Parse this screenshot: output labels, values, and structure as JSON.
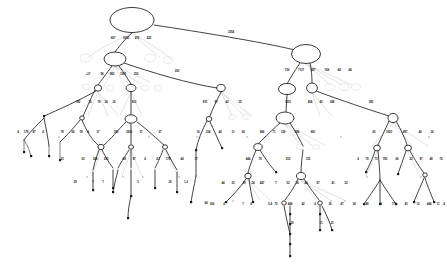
{
  "diagram": {
    "type": "tree",
    "background_color": "#ffffff",
    "node_fill": "#ffffff",
    "node_stroke": "#222222",
    "edge_color": "#2b2b2b",
    "ghost_color": "#c9c9c9",
    "leaf_color": "#1c1c1c",
    "canvas": {
      "width": 447,
      "height": 264
    }
  },
  "nodes": [
    {
      "id": "n-root",
      "shape": "ellipse",
      "cx": 132,
      "cy": 20,
      "rx": 22,
      "ry": 12.5
    },
    {
      "id": "n-l1",
      "shape": "ellipse",
      "cx": 115,
      "cy": 59,
      "rx": 11,
      "ry": 7
    },
    {
      "id": "n-r1",
      "shape": "ellipse",
      "cx": 306,
      "cy": 54,
      "rx": 14.5,
      "ry": 9.5
    },
    {
      "id": "n-l2a",
      "shape": "ellipse",
      "cx": 98,
      "cy": 88,
      "rx": 3.6,
      "ry": 3.2
    },
    {
      "id": "n-l2b",
      "shape": "ellipse",
      "cx": 131,
      "cy": 88,
      "rx": 5,
      "ry": 3.6
    },
    {
      "id": "n-l2c",
      "shape": "ellipse",
      "cx": 221,
      "cy": 88,
      "rx": 4.2,
      "ry": 3.6
    },
    {
      "id": "n-r2a",
      "shape": "ellipse",
      "cx": 287,
      "cy": 89,
      "rx": 8.5,
      "ry": 5.6
    },
    {
      "id": "n-r2b",
      "shape": "ellipse",
      "cx": 312,
      "cy": 88,
      "rx": 5.4,
      "ry": 5
    },
    {
      "id": "n-l3a",
      "shape": "ellipse",
      "cx": 82,
      "cy": 118,
      "rx": 2.3,
      "ry": 2.1
    },
    {
      "id": "n-l3b",
      "shape": "ellipse",
      "cx": 131,
      "cy": 119,
      "rx": 6,
      "ry": 4.2
    },
    {
      "id": "n-l3c",
      "shape": "ellipse",
      "cx": 209,
      "cy": 119,
      "rx": 2.8,
      "ry": 2.5
    },
    {
      "id": "n-r3a",
      "shape": "ellipse",
      "cx": 285,
      "cy": 118,
      "rx": 9,
      "ry": 6
    },
    {
      "id": "n-r3b",
      "shape": "ellipse",
      "cx": 393,
      "cy": 118,
      "rx": 5,
      "ry": 4.6
    },
    {
      "id": "n-l4a",
      "shape": "ellipse",
      "cx": 101,
      "cy": 147,
      "rx": 3.1,
      "ry": 2.7
    },
    {
      "id": "n-l4b",
      "shape": "ellipse",
      "cx": 131,
      "cy": 147,
      "rx": 2.5,
      "ry": 2.2
    },
    {
      "id": "n-l4c",
      "shape": "ellipse",
      "cx": 165,
      "cy": 147,
      "rx": 2.5,
      "ry": 2.2
    },
    {
      "id": "n-r4a",
      "shape": "ellipse",
      "cx": 258,
      "cy": 147,
      "rx": 4.2,
      "ry": 3.4
    },
    {
      "id": "n-r4b",
      "shape": "ellipse",
      "cx": 377,
      "cy": 148,
      "rx": 3.4,
      "ry": 2.9
    },
    {
      "id": "n-r4c",
      "shape": "ellipse",
      "cx": 408,
      "cy": 148,
      "rx": 3.4,
      "ry": 2.9
    },
    {
      "id": "n-r5a",
      "shape": "ellipse",
      "cx": 248,
      "cy": 176,
      "rx": 3.2,
      "ry": 2.8
    },
    {
      "id": "n-r5b",
      "shape": "ellipse",
      "cx": 301,
      "cy": 176,
      "rx": 4.6,
      "ry": 3.6
    },
    {
      "id": "n-r6a",
      "shape": "ellipse",
      "cx": 284,
      "cy": 203,
      "rx": 2.3,
      "ry": 2.1
    },
    {
      "id": "n-r6b",
      "shape": "ellipse",
      "cx": 320,
      "cy": 203,
      "rx": 2.3,
      "ry": 2.1
    },
    {
      "id": "n-r7a",
      "shape": "ellipse",
      "cx": 425,
      "cy": 175,
      "rx": 2.3,
      "ry": 2.1
    }
  ],
  "edge_labels": [
    {
      "id": "e-root-1",
      "text": "667",
      "x": 113,
      "y": 39
    },
    {
      "id": "e-root-2",
      "text": "5000",
      "x": 126,
      "y": 39
    },
    {
      "id": "e-root-3",
      "text": "476",
      "x": 137,
      "y": 39
    },
    {
      "id": "e-root-4",
      "text": "425",
      "x": 149,
      "y": 39
    },
    {
      "id": "e-root-5",
      "text": "2354",
      "x": 231,
      "y": 33
    },
    {
      "id": "e-l1-1",
      "text": "+17",
      "x": 88,
      "y": 75
    },
    {
      "id": "e-l1-2",
      "text": "96",
      "x": 102,
      "y": 75
    },
    {
      "id": "e-l1-3",
      "text": "982",
      "x": 112,
      "y": 75
    },
    {
      "id": "e-l1-4",
      "text": "1267",
      "x": 123,
      "y": 75
    },
    {
      "id": "e-l1-5",
      "text": "250",
      "x": 136,
      "y": 75
    },
    {
      "id": "e-l1-6",
      "text": "200",
      "x": 177,
      "y": 72
    },
    {
      "id": "e-r1-1",
      "text": "736",
      "x": 287,
      "y": 71
    },
    {
      "id": "e-r1-2",
      "text": "7137",
      "x": 301,
      "y": 71
    },
    {
      "id": "e-r1-3",
      "text": "897",
      "x": 313,
      "y": 71
    },
    {
      "id": "e-r1-4",
      "text": "566",
      "x": 327,
      "y": 71
    },
    {
      "id": "e-r1-5",
      "text": "44",
      "x": 339,
      "y": 71
    },
    {
      "id": "e-r1-6",
      "text": "44",
      "x": 350,
      "y": 71
    },
    {
      "id": "e-l2a-1",
      "text": "782",
      "x": 78,
      "y": 103
    },
    {
      "id": "e-l2a-2",
      "text": "76",
      "x": 90,
      "y": 103
    },
    {
      "id": "e-l2a-3",
      "text": "78",
      "x": 99,
      "y": 103
    },
    {
      "id": "e-l2a-4",
      "text": "34",
      "x": 106,
      "y": 103
    },
    {
      "id": "e-l2a-5",
      "text": "22",
      "x": 114,
      "y": 103
    },
    {
      "id": "e-l2b-1",
      "text": "923",
      "x": 134,
      "y": 103
    },
    {
      "id": "e-l2c-1",
      "text": "931",
      "x": 205,
      "y": 103
    },
    {
      "id": "e-l2c-2",
      "text": "97",
      "x": 216,
      "y": 103
    },
    {
      "id": "e-l2c-3",
      "text": "42",
      "x": 227,
      "y": 103
    },
    {
      "id": "e-l2c-4",
      "text": "35",
      "x": 240,
      "y": 103
    },
    {
      "id": "e-r2a-1",
      "text": "1251",
      "x": 288,
      "y": 103
    },
    {
      "id": "e-r2b-1",
      "text": "408",
      "x": 310,
      "y": 103
    },
    {
      "id": "e-r2b-2",
      "text": "43",
      "x": 321,
      "y": 103
    },
    {
      "id": "e-r2b-3",
      "text": "348",
      "x": 332,
      "y": 103
    },
    {
      "id": "e-r2b-4",
      "text": "583",
      "x": 371,
      "y": 103
    },
    {
      "id": "e-l3a-1",
      "text": "4",
      "x": 18,
      "y": 133
    },
    {
      "id": "e-l3a-2",
      "text": "179",
      "x": 26,
      "y": 133
    },
    {
      "id": "e-l3a-3",
      "text": "87",
      "x": 34,
      "y": 133
    },
    {
      "id": "e-l3a-4",
      "text": "4",
      "x": 43,
      "y": 133
    },
    {
      "id": "e-l3a-5",
      "text": "78",
      "x": 62,
      "y": 133
    },
    {
      "id": "e-l3a-6",
      "text": "66",
      "x": 73,
      "y": 133
    },
    {
      "id": "e-l3a-7",
      "text": "78",
      "x": 81,
      "y": 133
    },
    {
      "id": "e-l3a-8",
      "text": "4",
      "x": 88,
      "y": 133
    },
    {
      "id": "e-l3a-9",
      "text": "37",
      "x": 98,
      "y": 133
    },
    {
      "id": "e-l3b-1",
      "text": "190",
      "x": 116,
      "y": 133
    },
    {
      "id": "e-l3b-2",
      "text": "3500",
      "x": 129,
      "y": 133
    },
    {
      "id": "e-l3b-3",
      "text": "37",
      "x": 141,
      "y": 133
    },
    {
      "id": "e-l3b-4",
      "text": "67",
      "x": 160,
      "y": 133
    },
    {
      "id": "e-l3c-1",
      "text": "16",
      "x": 198,
      "y": 133
    },
    {
      "id": "e-l3c-2",
      "text": "334",
      "x": 208,
      "y": 133
    },
    {
      "id": "e-l3c-3",
      "text": "44",
      "x": 220,
      "y": 133
    },
    {
      "id": "e-l3c-4",
      "text": "11",
      "x": 233,
      "y": 133
    },
    {
      "id": "e-l3c-5",
      "text": "34",
      "x": 243,
      "y": 133
    },
    {
      "id": "e-r3a-1",
      "text": "946",
      "x": 262,
      "y": 133
    },
    {
      "id": "e-r3a-2",
      "text": "71",
      "x": 274,
      "y": 133
    },
    {
      "id": "e-r3a-3",
      "text": "128",
      "x": 283,
      "y": 133
    },
    {
      "id": "e-r3a-4",
      "text": "286",
      "x": 297,
      "y": 133
    },
    {
      "id": "e-r3a-5",
      "text": "861",
      "x": 313,
      "y": 133
    },
    {
      "id": "e-r3b-1",
      "text": "42",
      "x": 374,
      "y": 133
    },
    {
      "id": "e-r3b-2",
      "text": "1823",
      "x": 389,
      "y": 133
    },
    {
      "id": "e-r3b-3",
      "text": "687",
      "x": 405,
      "y": 133
    },
    {
      "id": "e-r3b-4",
      "text": "44",
      "x": 420,
      "y": 133
    },
    {
      "id": "e-r3b-5",
      "text": "36",
      "x": 432,
      "y": 133
    },
    {
      "id": "e-l4a-1",
      "text": "33",
      "x": 62,
      "y": 160
    },
    {
      "id": "e-l4a-2",
      "text": "52",
      "x": 83,
      "y": 160
    },
    {
      "id": "e-l4a-3",
      "text": "348",
      "x": 95,
      "y": 160
    },
    {
      "id": "e-l4a-4",
      "text": "290",
      "x": 106,
      "y": 160
    },
    {
      "id": "e-l4b-1",
      "text": "4.8",
      "x": 124,
      "y": 160
    },
    {
      "id": "e-l4b-2",
      "text": "97",
      "x": 134,
      "y": 160
    },
    {
      "id": "e-l4b-3",
      "text": "4",
      "x": 145,
      "y": 160
    },
    {
      "id": "e-l4c-1",
      "text": "4.7",
      "x": 158,
      "y": 160
    },
    {
      "id": "e-l4c-2",
      "text": "179",
      "x": 168,
      "y": 160
    },
    {
      "id": "e-l4c-3",
      "text": "44",
      "x": 182,
      "y": 160
    },
    {
      "id": "e-l4c-4",
      "text": "17",
      "x": 196,
      "y": 160
    },
    {
      "id": "e-r4a-1",
      "text": "444",
      "x": 248,
      "y": 160
    },
    {
      "id": "e-r4a-2",
      "text": "79",
      "x": 260,
      "y": 160
    },
    {
      "id": "e-r4a-3",
      "text": "253",
      "x": 288,
      "y": 160
    },
    {
      "id": "e-r4a-4",
      "text": "125",
      "x": 308,
      "y": 160
    },
    {
      "id": "e-r4b-1",
      "text": "4",
      "x": 358,
      "y": 160
    },
    {
      "id": "e-r4b-2",
      "text": "78",
      "x": 367,
      "y": 160
    },
    {
      "id": "e-r4b-3",
      "text": "73",
      "x": 376,
      "y": 160
    },
    {
      "id": "e-r4b-4",
      "text": "783",
      "x": 385,
      "y": 160
    },
    {
      "id": "e-r4b-5",
      "text": "66",
      "x": 397,
      "y": 160
    },
    {
      "id": "e-r4c-1",
      "text": "22",
      "x": 411,
      "y": 160
    },
    {
      "id": "e-r4c-2",
      "text": "97",
      "x": 421,
      "y": 160
    },
    {
      "id": "e-r4c-3",
      "text": "48",
      "x": 431,
      "y": 160
    },
    {
      "id": "e-r4c-4",
      "text": "76",
      "x": 441,
      "y": 160
    },
    {
      "id": "e-r5a-1",
      "text": "44",
      "x": 223,
      "y": 184
    },
    {
      "id": "e-r5a-2",
      "text": "23",
      "x": 233,
      "y": 184
    },
    {
      "id": "e-r5a-3",
      "text": "39",
      "x": 244,
      "y": 184
    },
    {
      "id": "e-r5a-4",
      "text": "24",
      "x": 253,
      "y": 184
    },
    {
      "id": "e-r5a-5",
      "text": "447",
      "x": 262,
      "y": 184
    },
    {
      "id": "e-r5a-6",
      "text": "7",
      "x": 276,
      "y": 184
    },
    {
      "id": "e-r5b-1",
      "text": "52",
      "x": 288,
      "y": 184
    },
    {
      "id": "e-r5b-2",
      "text": "14",
      "x": 297,
      "y": 184
    },
    {
      "id": "e-r5b-3",
      "text": "44",
      "x": 306,
      "y": 184
    },
    {
      "id": "e-r5b-4",
      "text": "97",
      "x": 318,
      "y": 184
    },
    {
      "id": "e-r5b-5",
      "text": "41",
      "x": 333,
      "y": 184
    },
    {
      "id": "e-r5b-6",
      "text": "22",
      "x": 346,
      "y": 184
    },
    {
      "id": "e-d1",
      "text": "29",
      "x": 75,
      "y": 183
    },
    {
      "id": "e-d2",
      "text": "7",
      "x": 93,
      "y": 183
    },
    {
      "id": "e-d3",
      "text": "7",
      "x": 103,
      "y": 183
    },
    {
      "id": "e-d4",
      "text": "5",
      "x": 138,
      "y": 183
    },
    {
      "id": "e-d5",
      "text": "1-2",
      "x": 186,
      "y": 183
    },
    {
      "id": "e-d6",
      "text": "20",
      "x": 170,
      "y": 183
    },
    {
      "id": "e-d7",
      "text": "44",
      "x": 206,
      "y": 204
    },
    {
      "id": "e-b1",
      "text": "300",
      "x": 212,
      "y": 205
    },
    {
      "id": "e-b2",
      "text": "4",
      "x": 224,
      "y": 205
    },
    {
      "id": "e-b3",
      "text": "7",
      "x": 243,
      "y": 205
    },
    {
      "id": "e-b4",
      "text": "4",
      "x": 251,
      "y": 205
    },
    {
      "id": "e-b5",
      "text": "5-4",
      "x": 270,
      "y": 205
    },
    {
      "id": "e-b6",
      "text": "72",
      "x": 276,
      "y": 205
    },
    {
      "id": "e-b7",
      "text": "444",
      "x": 290,
      "y": 205
    },
    {
      "id": "e-b8",
      "text": "42",
      "x": 303,
      "y": 205
    },
    {
      "id": "e-b9",
      "text": "4",
      "x": 315,
      "y": 205
    },
    {
      "id": "e-b10",
      "text": "36",
      "x": 330,
      "y": 205
    },
    {
      "id": "e-b11",
      "text": "47",
      "x": 342,
      "y": 205
    },
    {
      "id": "e-b12",
      "text": "34",
      "x": 354,
      "y": 205
    },
    {
      "id": "e-b13",
      "text": "48",
      "x": 367,
      "y": 205
    },
    {
      "id": "e-b14",
      "text": "4",
      "x": 381,
      "y": 205
    },
    {
      "id": "e-b15",
      "text": "773",
      "x": 394,
      "y": 205
    },
    {
      "id": "e-b16",
      "text": "43",
      "x": 406,
      "y": 205
    },
    {
      "id": "e-b17",
      "text": "12",
      "x": 418,
      "y": 205
    },
    {
      "id": "e-b18",
      "text": "444",
      "x": 429,
      "y": 205
    },
    {
      "id": "e-b19",
      "text": "11",
      "x": 438,
      "y": 205
    },
    {
      "id": "e-b20",
      "text": "4",
      "x": 444,
      "y": 205
    },
    {
      "id": "e-c1",
      "text": "30",
      "x": 292,
      "y": 224
    },
    {
      "id": "e-c2",
      "text": "11",
      "x": 321,
      "y": 224
    },
    {
      "id": "e-c3",
      "text": "23",
      "x": 332,
      "y": 224
    }
  ]
}
